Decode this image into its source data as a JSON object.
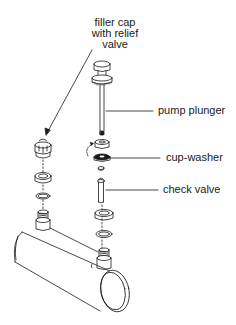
{
  "diagram": {
    "type": "exploded-assembly",
    "labels": {
      "filler_cap": [
        "filler cap",
        "with relief",
        "valve"
      ],
      "pump_plunger": "pump plunger",
      "cup_washer": "cup-washer",
      "check_valve": "check valve"
    },
    "colors": {
      "line": "#1a1a1a",
      "background": "#ffffff"
    }
  }
}
